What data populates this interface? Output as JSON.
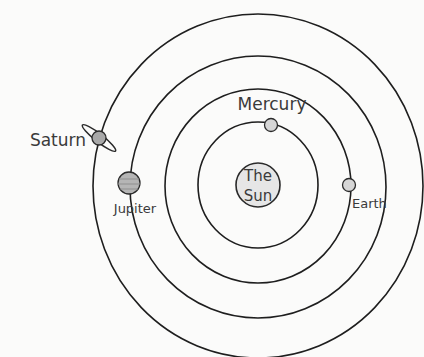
{
  "diagram": {
    "sun": {
      "label_line1": "The",
      "label_line2": "Sun"
    },
    "planets": [
      {
        "name": "Mercury",
        "label": "Mercury"
      },
      {
        "name": "Earth",
        "label": "Earth"
      },
      {
        "name": "Jupiter",
        "label": "Jupiter"
      },
      {
        "name": "Saturn",
        "label": "Saturn"
      }
    ],
    "orbit_count": 4
  }
}
